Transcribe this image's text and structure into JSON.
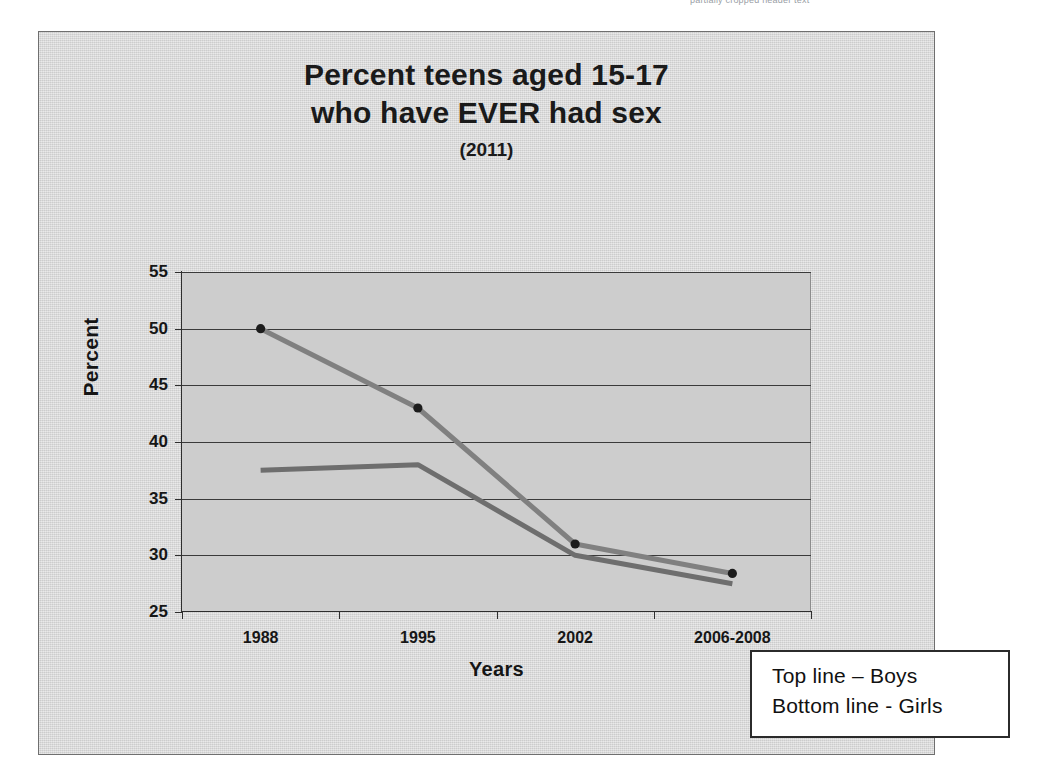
{
  "scan": {
    "header_sliver_text": "partially cropped header text"
  },
  "chart": {
    "title_line_1": "Percent teens aged 15-17",
    "title_line_2": "who have EVER had sex",
    "subtitle": "(2011)",
    "y_axis_title": "Percent",
    "x_axis_title": "Years"
  },
  "legend": {
    "line_1": "Top line – Boys",
    "line_2": "Bottom line - Girls"
  },
  "colors": {
    "boys_line": "#808080",
    "girls_line": "#6e6e6e",
    "marker": "#1c1c1c",
    "plot_background": "#cdcdcd",
    "frame_background": "#d9d9d9",
    "gridline": "#3a3a3a",
    "axis": "#2e2e2e",
    "legend_border": "#2b2b2b"
  },
  "chart_data": {
    "type": "line",
    "title": "Percent teens aged 15-17 who have EVER had sex (2011)",
    "xlabel": "Years",
    "ylabel": "Percent",
    "categories": [
      "1988",
      "1995",
      "2002",
      "2006-2008"
    ],
    "ylim": [
      25,
      55
    ],
    "yticks": [
      25,
      30,
      35,
      40,
      45,
      50,
      55
    ],
    "ytick_labels": [
      "25",
      "30",
      "35",
      "40",
      "45",
      "50",
      "55"
    ],
    "grid": "horizontal",
    "legend_position": "external-box-bottom-right",
    "series": [
      {
        "name": "Boys",
        "legend_text": "Top line – Boys",
        "values": [
          50,
          43,
          31,
          28.4
        ],
        "markers": true
      },
      {
        "name": "Girls",
        "legend_text": "Bottom line - Girls",
        "values": [
          37.5,
          38,
          30,
          27.5
        ],
        "markers": false
      }
    ]
  }
}
